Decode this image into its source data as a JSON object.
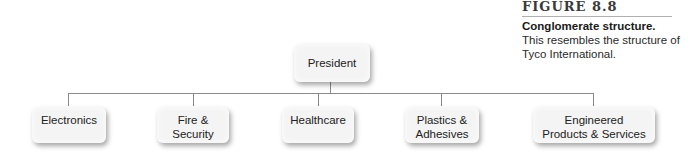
{
  "caption": {
    "figure_label": "FIGURE 8.8",
    "title": "Conglomerate structure.",
    "description": "This resembles the structure of Tyco International."
  },
  "org_chart": {
    "root": {
      "label": "President"
    },
    "children": [
      {
        "label": "Electronics"
      },
      {
        "label": "Fire & Security"
      },
      {
        "label": "Healthcare"
      },
      {
        "label": "Plastics & Adhesives"
      },
      {
        "label": "Engineered Products & Services"
      }
    ],
    "colors": {
      "box": "#f4f4f4",
      "connector": "#8a8a8a",
      "text": "#222222"
    }
  }
}
